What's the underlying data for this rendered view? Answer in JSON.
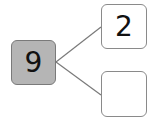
{
  "diagram": {
    "type": "number-bond",
    "whole": {
      "value": "9",
      "fill": "#b5b5b5"
    },
    "parts": [
      {
        "value": "2"
      },
      {
        "value": ""
      }
    ],
    "line_color": "#7a7a7a"
  }
}
